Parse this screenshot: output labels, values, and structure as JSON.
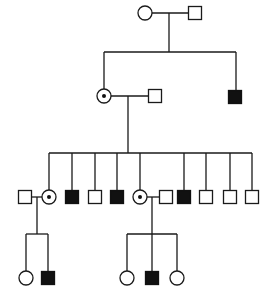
{
  "diagram": {
    "type": "pedigree",
    "colors": {
      "line": "#1a1a1a",
      "affected": "#111111",
      "background": "#ffffff"
    },
    "symbol_size": 13,
    "generations": [
      {
        "name": "I",
        "individuals": [
          {
            "id": "I-1",
            "sex": "female",
            "status": "unaffected",
            "x": 145,
            "y": 13
          },
          {
            "id": "I-2",
            "sex": "male",
            "status": "unaffected",
            "x": 195,
            "y": 13
          }
        ]
      },
      {
        "name": "II",
        "individuals": [
          {
            "id": "II-1",
            "sex": "female",
            "status": "carrier",
            "x": 104,
            "y": 96
          },
          {
            "id": "II-2",
            "sex": "male",
            "status": "unaffected",
            "x": 155,
            "y": 96
          },
          {
            "id": "II-3",
            "sex": "male",
            "status": "affected",
            "x": 235,
            "y": 97
          }
        ]
      },
      {
        "name": "III",
        "individuals": [
          {
            "id": "III-1",
            "sex": "male",
            "status": "unaffected",
            "x": 25,
            "y": 197
          },
          {
            "id": "III-2",
            "sex": "female",
            "status": "carrier",
            "x": 49,
            "y": 197
          },
          {
            "id": "III-3",
            "sex": "male",
            "status": "affected",
            "x": 72,
            "y": 197
          },
          {
            "id": "III-4",
            "sex": "male",
            "status": "unaffected",
            "x": 95,
            "y": 197
          },
          {
            "id": "III-5",
            "sex": "male",
            "status": "affected",
            "x": 117,
            "y": 197
          },
          {
            "id": "III-6",
            "sex": "female",
            "status": "carrier",
            "x": 140,
            "y": 197
          },
          {
            "id": "III-7",
            "sex": "male",
            "status": "unaffected",
            "x": 166,
            "y": 197
          },
          {
            "id": "III-8",
            "sex": "male",
            "status": "affected",
            "x": 184,
            "y": 197
          },
          {
            "id": "III-9",
            "sex": "male",
            "status": "unaffected",
            "x": 206,
            "y": 197
          },
          {
            "id": "III-10",
            "sex": "male",
            "status": "unaffected",
            "x": 230,
            "y": 197
          },
          {
            "id": "III-11",
            "sex": "male",
            "status": "unaffected",
            "x": 252,
            "y": 197
          }
        ]
      },
      {
        "name": "IV",
        "individuals": [
          {
            "id": "IV-1",
            "sex": "female",
            "status": "unaffected",
            "x": 26,
            "y": 278
          },
          {
            "id": "IV-2",
            "sex": "male",
            "status": "affected",
            "x": 48,
            "y": 278
          },
          {
            "id": "IV-3",
            "sex": "female",
            "status": "unaffected",
            "x": 127,
            "y": 278
          },
          {
            "id": "IV-4",
            "sex": "male",
            "status": "affected",
            "x": 152,
            "y": 278
          },
          {
            "id": "IV-5",
            "sex": "female",
            "status": "unaffected",
            "x": 177,
            "y": 278
          }
        ]
      }
    ],
    "lines": [
      {
        "kind": "marriage",
        "x1": 152,
        "y1": 13,
        "x2": 189,
        "y2": 13
      },
      {
        "kind": "descent",
        "x1": 169,
        "y1": 13,
        "x2": 169,
        "y2": 52
      },
      {
        "kind": "sibship",
        "x1": 104,
        "y1": 52,
        "x2": 236,
        "y2": 52
      },
      {
        "kind": "drop",
        "x1": 104,
        "y1": 52,
        "x2": 104,
        "y2": 89
      },
      {
        "kind": "drop",
        "x1": 236,
        "y1": 52,
        "x2": 236,
        "y2": 90
      },
      {
        "kind": "marriage",
        "x1": 111,
        "y1": 96,
        "x2": 149,
        "y2": 96
      },
      {
        "kind": "descent",
        "x1": 128,
        "y1": 96,
        "x2": 128,
        "y2": 153
      },
      {
        "kind": "sibship",
        "x1": 49,
        "y1": 153,
        "x2": 252,
        "y2": 153
      },
      {
        "kind": "drop",
        "x1": 49,
        "y1": 153,
        "x2": 49,
        "y2": 190
      },
      {
        "kind": "drop",
        "x1": 72,
        "y1": 153,
        "x2": 72,
        "y2": 190
      },
      {
        "kind": "drop",
        "x1": 95,
        "y1": 153,
        "x2": 95,
        "y2": 190
      },
      {
        "kind": "drop",
        "x1": 117,
        "y1": 153,
        "x2": 117,
        "y2": 190
      },
      {
        "kind": "drop",
        "x1": 140,
        "y1": 153,
        "x2": 140,
        "y2": 190
      },
      {
        "kind": "drop",
        "x1": 184,
        "y1": 153,
        "x2": 184,
        "y2": 190
      },
      {
        "kind": "drop",
        "x1": 206,
        "y1": 153,
        "x2": 206,
        "y2": 190
      },
      {
        "kind": "drop",
        "x1": 230,
        "y1": 153,
        "x2": 230,
        "y2": 190
      },
      {
        "kind": "drop",
        "x1": 252,
        "y1": 153,
        "x2": 252,
        "y2": 190
      },
      {
        "kind": "marriage",
        "x1": 31,
        "y1": 197,
        "x2": 42,
        "y2": 197
      },
      {
        "kind": "descent",
        "x1": 37,
        "y1": 197,
        "x2": 37,
        "y2": 234
      },
      {
        "kind": "sibship",
        "x1": 26,
        "y1": 234,
        "x2": 48,
        "y2": 234
      },
      {
        "kind": "drop",
        "x1": 26,
        "y1": 234,
        "x2": 26,
        "y2": 271
      },
      {
        "kind": "drop",
        "x1": 48,
        "y1": 234,
        "x2": 48,
        "y2": 271
      },
      {
        "kind": "marriage",
        "x1": 147,
        "y1": 197,
        "x2": 160,
        "y2": 197
      },
      {
        "kind": "descent",
        "x1": 152,
        "y1": 197,
        "x2": 152,
        "y2": 234
      },
      {
        "kind": "sibship",
        "x1": 127,
        "y1": 234,
        "x2": 177,
        "y2": 234
      },
      {
        "kind": "drop",
        "x1": 127,
        "y1": 234,
        "x2": 127,
        "y2": 271
      },
      {
        "kind": "drop",
        "x1": 152,
        "y1": 234,
        "x2": 152,
        "y2": 271
      },
      {
        "kind": "drop",
        "x1": 177,
        "y1": 234,
        "x2": 177,
        "y2": 271
      }
    ]
  }
}
